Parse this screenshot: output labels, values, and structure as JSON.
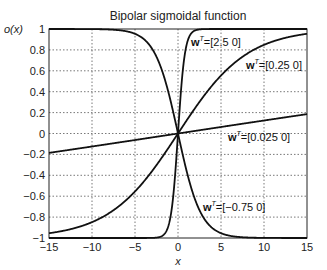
{
  "chart_data": {
    "type": "line",
    "title": "Bipolar sigmoidal function",
    "xlabel": "x",
    "ylabel": "o(x)",
    "xlim": [
      -15,
      15
    ],
    "ylim": [
      -1,
      1
    ],
    "grid": true,
    "x_ticks": [
      "-15",
      "-10",
      "-5",
      "0",
      "5",
      "10",
      "15"
    ],
    "y_ticks": [
      "1",
      "0.8",
      "0.6",
      "0.4",
      "0.2",
      "0",
      "-0.2",
      "-0.4",
      "-0.6",
      "-0.8",
      "-1"
    ],
    "function": "o(x) = (1 - exp(-w x)) / (1 + exp(-w x)) = tanh(w x / 2)",
    "series": [
      {
        "name": "w^T=[2.5 0]",
        "w": 2.5,
        "label_w": "w",
        "label_sup": "T",
        "label_rest": "=[2.5  0]"
      },
      {
        "name": "w^T=[0.25 0]",
        "w": 0.25,
        "label_w": "w",
        "label_sup": "T",
        "label_rest": "=[0.25  0]"
      },
      {
        "name": "w^T=[0.025 0]",
        "w": 0.025,
        "label_w": "w",
        "label_sup": "T",
        "label_rest": "=[0.025  0]"
      },
      {
        "name": "w^T=[-0.75 0]",
        "w": -0.75,
        "label_w": "w",
        "label_sup": "T",
        "label_rest": "=[−0.75  0]"
      }
    ]
  }
}
